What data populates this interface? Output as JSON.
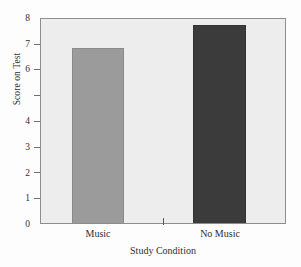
{
  "chart_data": {
    "type": "bar",
    "title": "",
    "xlabel": "Study Condition",
    "ylabel": "Score on Test",
    "categories": [
      "Music",
      "No Music"
    ],
    "values": [
      6.8,
      7.7
    ],
    "series": [
      {
        "name": "Score on Test",
        "values": [
          6.8,
          7.7
        ]
      }
    ],
    "ylim": [
      0,
      8
    ],
    "ytick_values": [
      0,
      1,
      2,
      3,
      4,
      5,
      6,
      7,
      8
    ],
    "ytick_labels": [
      "0",
      "1",
      "2",
      "3",
      "4",
      "",
      "6",
      "7",
      "8"
    ],
    "grid": false,
    "legend": "none",
    "bar_colors": [
      "#9b9b9b",
      "#3b3b3b"
    ],
    "plot_background": "#ededed",
    "frame_color": "#8d8d8d"
  }
}
